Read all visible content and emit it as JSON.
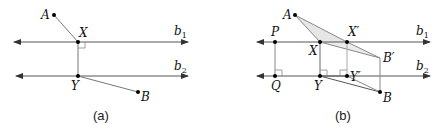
{
  "panels": [
    {
      "caption": "(a)",
      "lines": [
        {
          "label": "b",
          "sub": "1"
        },
        {
          "label": "b",
          "sub": "2"
        }
      ],
      "points": {
        "A": "A",
        "X": "X",
        "Y": "Y",
        "B": "B"
      }
    },
    {
      "caption": "(b)",
      "lines": [
        {
          "label": "b",
          "sub": "1"
        },
        {
          "label": "b",
          "sub": "2"
        }
      ],
      "points": {
        "A": "A",
        "P": "P",
        "X": "X",
        "Xp": "X′",
        "Bp": "B′",
        "Q": "Q",
        "Y": "Y",
        "Yp": "Y′",
        "B": "B"
      }
    }
  ],
  "colors": {
    "line": "#555555",
    "shade": "#e6e6e6",
    "point": "#000000"
  }
}
